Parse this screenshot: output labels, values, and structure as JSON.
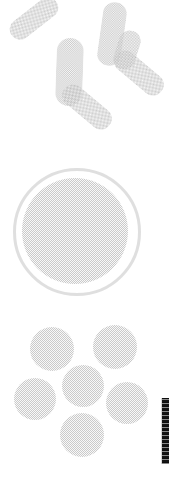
{
  "figure": {
    "title": "Bacterial morphology panel",
    "background_color": "#ffffff",
    "width": 169,
    "height": 479,
    "ink_color": "#6e6e6e",
    "fill_color": "#f4f4f4",
    "texture": "halftone-dither",
    "overall_tone": "very-faint"
  },
  "groups": [
    {
      "id": "bacilli",
      "label": "Rod-shaped bacteria (bacilli)",
      "shape": "rod",
      "count": 6
    },
    {
      "id": "encapsulated-coccus",
      "label": "Encapsulated coccus with capsule halo",
      "shape": "circle-with-ring",
      "count": 1
    },
    {
      "id": "cocci-cluster",
      "label": "Spherical bacteria (cocci) cluster",
      "shape": "circle",
      "count": 6
    }
  ],
  "bacilli": [
    {
      "name": "rod-1",
      "x": 6,
      "y": 8,
      "w": 56,
      "h": 21,
      "rotate": -38
    },
    {
      "name": "rod-2",
      "x": 100,
      "y": 2,
      "w": 24,
      "h": 64,
      "rotate": 8
    },
    {
      "name": "rod-3",
      "x": 56,
      "y": 38,
      "w": 27,
      "h": 68,
      "rotate": 2
    },
    {
      "name": "rod-4",
      "x": 110,
      "y": 62,
      "w": 58,
      "h": 22,
      "rotate": 40
    },
    {
      "name": "rod-5",
      "x": 58,
      "y": 96,
      "w": 58,
      "h": 22,
      "rotate": 40
    },
    {
      "name": "rod-6",
      "x": 116,
      "y": 30,
      "w": 22,
      "h": 40,
      "rotate": 18
    }
  ],
  "capsule": {
    "ring": {
      "name": "capsule-halo",
      "x": 13,
      "y": 8,
      "size": 122
    },
    "body": {
      "name": "coccus-body",
      "x": 22,
      "y": 18,
      "size": 106
    }
  },
  "cocci": [
    {
      "name": "coccus-1",
      "x": 30,
      "y": 17,
      "size": 44
    },
    {
      "name": "coccus-2",
      "x": 93,
      "y": 15,
      "size": 44
    },
    {
      "name": "coccus-3",
      "x": 62,
      "y": 55,
      "size": 42
    },
    {
      "name": "coccus-4",
      "x": 14,
      "y": 68,
      "size": 42
    },
    {
      "name": "coccus-5",
      "x": 106,
      "y": 72,
      "size": 42
    },
    {
      "name": "coccus-6",
      "x": 60,
      "y": 103,
      "size": 44
    }
  ],
  "scale_strip": {
    "name": "scale-strip",
    "label": "Scale bar",
    "color": "#111111",
    "x": 162,
    "y": 398,
    "width": 7,
    "height": 66
  }
}
